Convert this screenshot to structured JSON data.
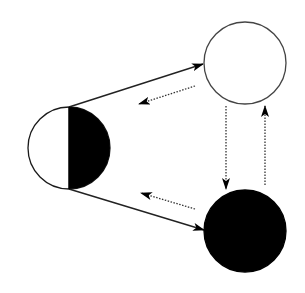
{
  "diagram": {
    "type": "state-transition",
    "background": "#ffffff",
    "stroke_color": "#1a1a1a",
    "fill_black": "#000000",
    "fill_white": "#ffffff",
    "nodes": [
      {
        "id": "half",
        "label": "",
        "shape": "half-filled circle (left white, right black)",
        "cx": 69,
        "cy": 148,
        "r": 41
      },
      {
        "id": "white",
        "label": "",
        "shape": "white circle",
        "cx": 245,
        "cy": 63,
        "r": 41
      },
      {
        "id": "black",
        "label": "",
        "shape": "black circle",
        "cx": 245,
        "cy": 231,
        "r": 41
      }
    ],
    "edges": [
      {
        "from": "half",
        "to": "white",
        "style": "solid",
        "x1": 69,
        "y1": 107,
        "x2": 203,
        "y2": 64
      },
      {
        "from": "half",
        "to": "black",
        "style": "solid",
        "x1": 69,
        "y1": 189,
        "x2": 204,
        "y2": 230
      },
      {
        "from": "white",
        "to": "half",
        "style": "dotted",
        "x1": 195,
        "y1": 86,
        "x2": 139,
        "y2": 104
      },
      {
        "from": "black",
        "to": "half",
        "style": "dotted",
        "x1": 195,
        "y1": 209,
        "x2": 141,
        "y2": 193
      },
      {
        "from": "white",
        "to": "black",
        "style": "dotted",
        "x1": 226,
        "y1": 106,
        "x2": 226,
        "y2": 189
      },
      {
        "from": "black",
        "to": "white",
        "style": "dotted",
        "x1": 265,
        "y1": 185,
        "x2": 265,
        "y2": 106
      }
    ]
  }
}
